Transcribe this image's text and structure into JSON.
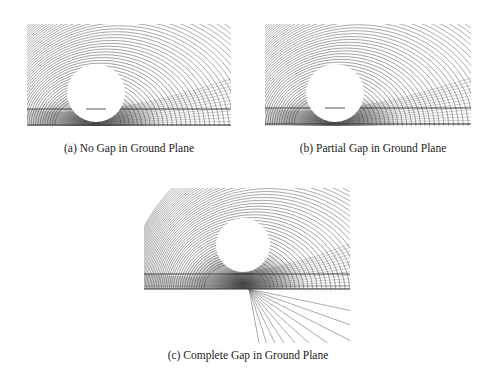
{
  "figure": {
    "background": "#ffffff",
    "line_color": "#555555",
    "panels": [
      {
        "id": "a",
        "caption": "(a) No Gap in Ground Plane",
        "box": {
          "x": 27,
          "y": 24,
          "w": 204,
          "h": 102
        },
        "circle": {
          "cx": 69,
          "cy": 69,
          "r": 29
        },
        "upper_line_y": 85,
        "ground_line_y": 101,
        "gap": "none",
        "caption_pos": {
          "x": 129,
          "y": 150
        }
      },
      {
        "id": "b",
        "caption": "(b) Partial Gap in Ground Plane",
        "box": {
          "x": 265,
          "y": 24,
          "w": 206,
          "h": 102
        },
        "circle": {
          "cx": 70,
          "cy": 69,
          "r": 29
        },
        "upper_line_y": 84,
        "ground_line_y": 100,
        "gap": "partial",
        "caption_pos": {
          "x": 373,
          "y": 150
        }
      },
      {
        "id": "c",
        "caption": "(c) Complete Gap in Ground Plane",
        "box": {
          "x": 144,
          "y": 188,
          "w": 206,
          "h": 155
        },
        "circle": {
          "cx": 99,
          "cy": 57,
          "r": 27
        },
        "upper_line_y": 86,
        "ground_line_y": 101,
        "gap": "complete",
        "gap_vertex": {
          "x": 105,
          "y": 101
        },
        "caption_pos": {
          "x": 248,
          "y": 357
        }
      }
    ]
  }
}
